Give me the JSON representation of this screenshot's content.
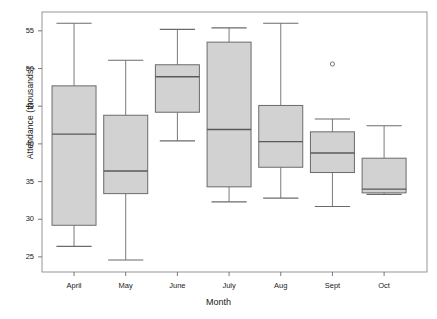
{
  "chart_data": {
    "type": "box",
    "title": "",
    "xlabel": "Month",
    "ylabel": "Attendance (thousands)",
    "categories": [
      "April",
      "May",
      "June",
      "July",
      "Aug",
      "Sept",
      "Oct"
    ],
    "ylim": [
      23.0,
      57.5
    ],
    "yticks": [
      25,
      30,
      35,
      40,
      45,
      50,
      55
    ],
    "ytick_labels": [
      "25",
      "30",
      "35",
      "40",
      "45",
      "50",
      "55"
    ],
    "grid": false,
    "legend": null,
    "box_fill_color": "#d2d2d2",
    "box_edge_color": "#6b6b6b",
    "median_color": "#5a5a5a",
    "whisker_color": "#6b6b6b",
    "outlier_marker": "circle",
    "boxes": [
      {
        "category": "April",
        "whisker_low": 26.4,
        "q1": 29.2,
        "median": 41.3,
        "q3": 47.7,
        "whisker_high": 56.0,
        "outliers": []
      },
      {
        "category": "May",
        "whisker_low": 24.6,
        "q1": 33.4,
        "median": 36.4,
        "q3": 43.8,
        "whisker_high": 51.1,
        "outliers": []
      },
      {
        "category": "June",
        "whisker_low": 40.4,
        "q1": 44.2,
        "median": 48.9,
        "q3": 50.5,
        "whisker_high": 55.2,
        "outliers": []
      },
      {
        "category": "July",
        "whisker_low": 32.3,
        "q1": 34.3,
        "median": 41.9,
        "q3": 53.5,
        "whisker_high": 55.4,
        "outliers": []
      },
      {
        "category": "Aug",
        "whisker_low": 32.8,
        "q1": 36.9,
        "median": 40.3,
        "q3": 45.1,
        "whisker_high": 56.0,
        "outliers": []
      },
      {
        "category": "Sept",
        "whisker_low": 31.7,
        "q1": 36.2,
        "median": 38.8,
        "q3": 41.6,
        "whisker_high": 43.3,
        "outliers": [
          50.6
        ]
      },
      {
        "category": "Oct",
        "whisker_low": 33.3,
        "q1": 33.5,
        "median": 34.0,
        "q3": 38.1,
        "whisker_high": 42.4,
        "outliers": []
      }
    ]
  },
  "axes": {
    "y_title": "Attendance (thousands)",
    "x_title": "Month",
    "ytick_labels": [
      "55",
      "50",
      "45",
      "40",
      "35",
      "30",
      "25"
    ],
    "xtick_labels": [
      "April",
      "May",
      "June",
      "July",
      "Aug",
      "Sept",
      "Oct"
    ]
  }
}
